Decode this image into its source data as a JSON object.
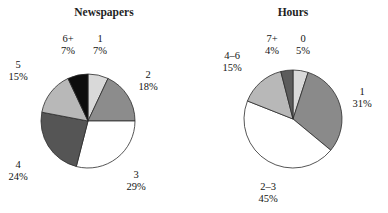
{
  "figure": {
    "background": "#ffffff",
    "width": 388,
    "height": 213,
    "outline_color": "#2b2b2b"
  },
  "chart_data": [
    {
      "type": "pie",
      "title": "Newspapers",
      "xlabel": "",
      "ylabel": "",
      "legend": "none",
      "grid": false,
      "start_angle_deg": 90,
      "direction": "clockwise",
      "center": {
        "cx": 88,
        "cy": 121,
        "r": 47
      },
      "categories": [
        "1",
        "2",
        "3",
        "4",
        "5",
        "6+"
      ],
      "values": [
        7,
        18,
        29,
        24,
        15,
        7
      ],
      "value_labels": [
        "7%",
        "18%",
        "29%",
        "24%",
        "15%",
        "7%"
      ],
      "colors": [
        "#d9d9d9",
        "#8c8c8c",
        "#ffffff",
        "#555555",
        "#b8b8b8",
        "#0d0d0d"
      ],
      "slices": [
        {
          "name": "1",
          "percent": 7,
          "label": "1",
          "percent_label": "7%",
          "color": "#d9d9d9",
          "label_x": 100,
          "label_y": 42,
          "anchor": "middle"
        },
        {
          "name": "2",
          "percent": 18,
          "label": "2",
          "percent_label": "18%",
          "color": "#8c8c8c",
          "label_x": 148,
          "label_y": 78,
          "anchor": "middle"
        },
        {
          "name": "3",
          "percent": 29,
          "label": "3",
          "percent_label": "29%",
          "color": "#ffffff",
          "label_x": 136,
          "label_y": 178,
          "anchor": "middle"
        },
        {
          "name": "4",
          "percent": 24,
          "label": "4",
          "percent_label": "24%",
          "color": "#555555",
          "label_x": 18,
          "label_y": 168,
          "anchor": "middle"
        },
        {
          "name": "5",
          "percent": 15,
          "label": "5",
          "percent_label": "15%",
          "color": "#b8b8b8",
          "label_x": 18,
          "label_y": 68,
          "anchor": "middle"
        },
        {
          "name": "6+",
          "percent": 7,
          "label": "6+",
          "percent_label": "7%",
          "color": "#0d0d0d",
          "label_x": 68,
          "label_y": 42,
          "anchor": "middle"
        }
      ]
    },
    {
      "type": "pie",
      "title": "Hours",
      "xlabel": "",
      "ylabel": "",
      "legend": "none",
      "grid": false,
      "start_angle_deg": 90,
      "direction": "clockwise",
      "center": {
        "cx": 293,
        "cy": 119,
        "r": 49
      },
      "categories": [
        "0",
        "1",
        "2–3",
        "4–6",
        "7+"
      ],
      "values": [
        5,
        31,
        45,
        15,
        4
      ],
      "value_labels": [
        "5%",
        "31%",
        "45%",
        "15%",
        "4%"
      ],
      "colors": [
        "#d9d9d9",
        "#8a8a8a",
        "#ffffff",
        "#b8b8b8",
        "#5c5c5c"
      ],
      "slices": [
        {
          "name": "0",
          "percent": 5,
          "label": "0",
          "percent_label": "5%",
          "color": "#d9d9d9",
          "label_x": 303,
          "label_y": 42,
          "anchor": "middle"
        },
        {
          "name": "1",
          "percent": 31,
          "label": "1",
          "percent_label": "31%",
          "color": "#8a8a8a",
          "label_x": 362,
          "label_y": 95,
          "anchor": "middle"
        },
        {
          "name": "2-3",
          "percent": 45,
          "label": "2–3",
          "percent_label": "45%",
          "color": "#ffffff",
          "label_x": 268,
          "label_y": 190,
          "anchor": "middle"
        },
        {
          "name": "4-6",
          "percent": 15,
          "label": "4–6",
          "percent_label": "15%",
          "color": "#b8b8b8",
          "label_x": 232,
          "label_y": 59,
          "anchor": "middle"
        },
        {
          "name": "7+",
          "percent": 4,
          "label": "7+",
          "percent_label": "4%",
          "color": "#5c5c5c",
          "label_x": 272,
          "label_y": 42,
          "anchor": "middle"
        }
      ]
    }
  ],
  "charts": [
    {
      "title_x": 104,
      "title_y": 16
    },
    {
      "title_x": 293,
      "title_y": 16
    }
  ]
}
